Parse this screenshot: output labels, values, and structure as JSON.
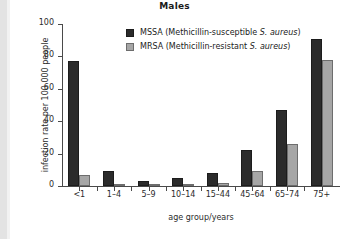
{
  "chart_data": {
    "type": "bar",
    "title": "Males",
    "xlabel": "age group/years",
    "ylabel": "infection rate per 100 000 people",
    "categories": [
      "<1",
      "1–4",
      "5–9",
      "10–14",
      "15–44",
      "45–64",
      "65–74",
      "75+"
    ],
    "series": [
      {
        "name": "MSSA (Methicillin-susceptible S. aureus)",
        "color": "#2b2b2b",
        "values": [
          77,
          9,
          3,
          5,
          8,
          22,
          47,
          91
        ]
      },
      {
        "name": "MRSA (Methicillin-resistant S. aureus)",
        "color": "#a6a6a6",
        "values": [
          7,
          1,
          0,
          0,
          2,
          9,
          26,
          78
        ]
      }
    ],
    "ylim": [
      0,
      100
    ],
    "yticks": [
      0,
      20,
      40,
      60,
      80,
      100
    ],
    "grid": false,
    "legend_position": "top-center"
  },
  "legend": {
    "items": [
      {
        "abbr": "MSSA",
        "expansion_prefix": " (Methicillin-susceptible ",
        "organism": "S. aureus",
        "expansion_suffix": ")",
        "swatch": "mssa"
      },
      {
        "abbr": "MRSA",
        "expansion_prefix": " (Methicillin-resistant ",
        "organism": "S. aureus",
        "expansion_suffix": ")",
        "swatch": "mrsa"
      }
    ]
  }
}
